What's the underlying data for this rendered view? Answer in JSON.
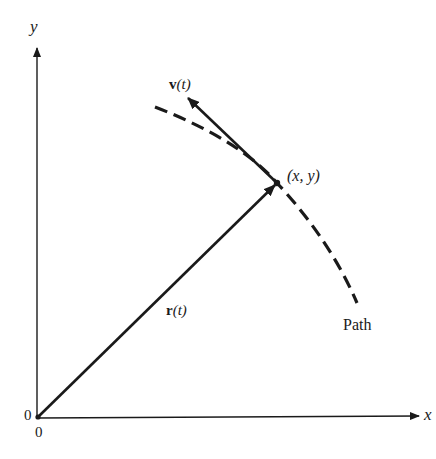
{
  "diagram": {
    "type": "position-velocity-vector-diagram",
    "colors": {
      "ink": "#1a1a1a",
      "background": "#ffffff"
    },
    "axes": {
      "x_label": "x",
      "y_label": "y",
      "origin_labels": [
        "0",
        "0"
      ]
    },
    "point": {
      "label": "(x, y)"
    },
    "vectors": {
      "position": {
        "symbol": "r",
        "arg": "(t)"
      },
      "velocity": {
        "symbol": "v",
        "arg": "(t)"
      }
    },
    "path": {
      "label": "Path",
      "style": "dashed"
    }
  }
}
